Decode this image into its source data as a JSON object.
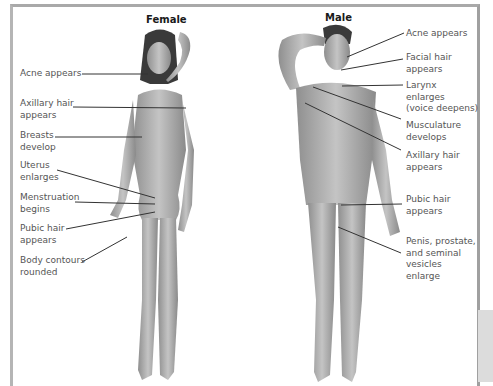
{
  "figure": {
    "female": {
      "heading": "Female",
      "labels": [
        {
          "id": "acne",
          "text": "Acne appears"
        },
        {
          "id": "axillary",
          "text": "Axillary hair\nappears"
        },
        {
          "id": "breasts",
          "text": "Breasts\ndevelop"
        },
        {
          "id": "uterus",
          "text": "Uterus\nenlarges"
        },
        {
          "id": "menstruation",
          "text": "Menstruation\nbegins"
        },
        {
          "id": "pubic",
          "text": "Pubic hair\nappears"
        },
        {
          "id": "contours",
          "text": "Body contours\nrounded"
        }
      ]
    },
    "male": {
      "heading": "Male",
      "labels": [
        {
          "id": "acne",
          "text": "Acne appears"
        },
        {
          "id": "facial",
          "text": "Facial hair\nappears"
        },
        {
          "id": "larynx",
          "text": "Larynx\nenlarges\n(voice deepens)"
        },
        {
          "id": "musculature",
          "text": "Musculature\ndevelops"
        },
        {
          "id": "axillary",
          "text": "Axillary hair\nappears"
        },
        {
          "id": "pubic",
          "text": "Pubic hair\nappears"
        },
        {
          "id": "genitals",
          "text": "Penis, prostate,\nand seminal\nvesicles\nenlarge"
        }
      ]
    }
  },
  "colors": {
    "label_text": "#555555",
    "heading_text": "#1a1a1a",
    "leader_line": "#333333",
    "figure_fill": "#a8a8a8",
    "border": "#aaaaaa"
  }
}
